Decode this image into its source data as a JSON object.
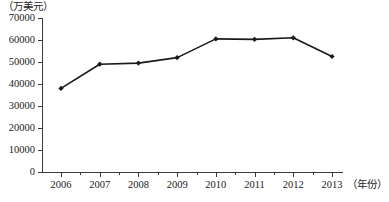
{
  "chart_data": {
    "type": "line",
    "title": "",
    "xlabel": "（年份）",
    "ylabel": "（万美元）",
    "categories": [
      "2006",
      "2007",
      "2008",
      "2009",
      "2010",
      "2011",
      "2012",
      "2013"
    ],
    "values": [
      38000,
      49000,
      49500,
      52000,
      60500,
      60300,
      61000,
      52500
    ],
    "series": [
      {
        "name": "",
        "values": [
          38000,
          49000,
          49500,
          52000,
          60500,
          60300,
          61000,
          52500
        ]
      }
    ],
    "ylim": [
      0,
      70000
    ],
    "yticks": [
      0,
      10000,
      20000,
      30000,
      40000,
      50000,
      60000,
      70000
    ],
    "ytick_labels": [
      "0",
      "10000",
      "20000",
      "30000",
      "40000",
      "50000",
      "60000",
      "70000"
    ],
    "xtick_labels": [
      "2006",
      "2007",
      "2008",
      "2009",
      "2010",
      "2011",
      "2012",
      "2013"
    ],
    "grid": false,
    "legend": "none",
    "marker": "diamond",
    "line_color": "#1a1a1a",
    "marker_color": "#1a1a1a",
    "axis_color": "#3a3a3a",
    "background_color": "#ffffff"
  },
  "axes": {
    "y_unit_label": "（万美元）",
    "x_unit_label": "（年份）"
  },
  "caption": {
    "text": ""
  }
}
